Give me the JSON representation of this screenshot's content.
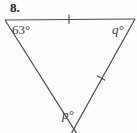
{
  "figure": {
    "problem_number": "8.",
    "shape": "triangle",
    "stroke_color": "#4a4a4a",
    "background_color": "#fdfdfd",
    "text_color": "#3f3f3f"
  },
  "labels": {
    "known_angle": "63°",
    "unknown_angle_right": "q°",
    "unknown_angle_bottom": "p°"
  },
  "geometry": {
    "vertices": {
      "top_left": [
        5,
        20
      ],
      "top_right": [
        134,
        19
      ],
      "bottom": [
        74,
        136
      ]
    },
    "tick_marks": [
      {
        "side": "top",
        "x": 69,
        "y": 19,
        "count": 1
      },
      {
        "side": "right",
        "x": 101,
        "y": 78,
        "count": 1
      }
    ]
  }
}
